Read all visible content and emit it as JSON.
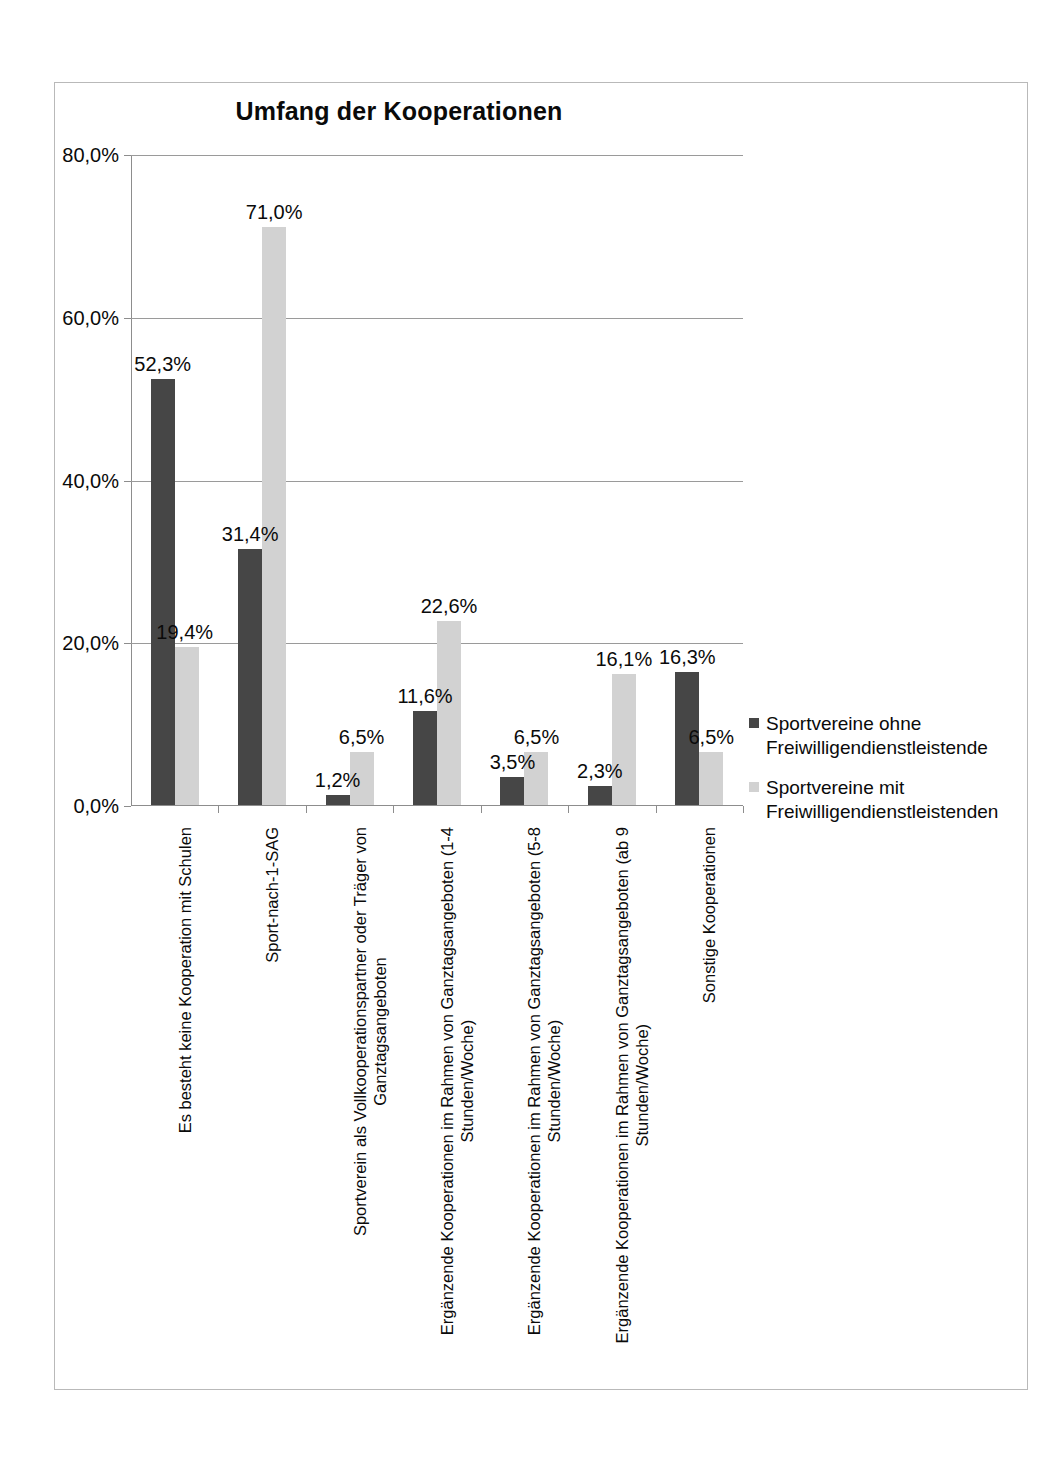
{
  "chart_data": {
    "type": "bar",
    "title": "Umfang der Kooperationen",
    "xlabel": "",
    "ylabel": "",
    "ylim": [
      0,
      80
    ],
    "grid": true,
    "legend_position": "right",
    "ytick_labels": [
      "80,0%",
      "60,0%",
      "40,0%",
      "20,0%",
      "0,0%"
    ],
    "ytick_values": [
      80,
      60,
      40,
      20,
      0
    ],
    "categories": [
      "Es besteht keine Kooperation mit Schulen",
      "Sport-nach-1-SAG",
      "Sportverein als Vollkooperationspartner oder Träger von Ganztagsangeboten",
      "Ergänzende Kooperationen im Rahmen von Ganztagsangeboten (1-4 Stunden/Woche)",
      "Ergänzende Kooperationen im Rahmen von Ganztagsangeboten (5-8 Stunden/Woche)",
      "Ergänzende Kooperationen im Rahmen von Ganztagsangeboten (ab 9 Stunden/Woche)",
      "Sonstige Kooperationen"
    ],
    "categories_lines": [
      [
        "Es besteht keine Kooperation mit Schulen",
        ""
      ],
      [
        "Sport-nach-1-SAG",
        ""
      ],
      [
        "Sportverein als Vollkooperationspartner oder Träger von",
        "Ganztagsangeboten"
      ],
      [
        "Ergänzende Kooperationen im Rahmen von Ganztagsangeboten (1-4",
        "Stunden/Woche)"
      ],
      [
        "Ergänzende Kooperationen im Rahmen von Ganztagsangeboten (5-8",
        "Stunden/Woche)"
      ],
      [
        "Ergänzende Kooperationen im Rahmen von Ganztagsangeboten (ab 9",
        "Stunden/Woche)"
      ],
      [
        "Sonstige Kooperationen",
        ""
      ]
    ],
    "series": [
      {
        "name": "Sportvereine ohne Freiwilligendienstleistende",
        "color": "#464646",
        "values": [
          52.3,
          31.4,
          1.2,
          11.6,
          3.5,
          2.3,
          16.3
        ],
        "labels": [
          "52,3%",
          "31,4%",
          "1,2%",
          "11,6%",
          "3,5%",
          "2,3%",
          "16,3%"
        ]
      },
      {
        "name": "Sportvereine mit Freiwilligendienstleistenden",
        "color": "#d2d2d2",
        "values": [
          19.4,
          71.0,
          6.5,
          22.6,
          6.5,
          16.1,
          6.5
        ],
        "labels": [
          "19,4%",
          "71,0%",
          "6,5%",
          "22,6%",
          "6,5%",
          "16,1%",
          "6,5%"
        ]
      }
    ]
  },
  "legend": {
    "entries": [
      {
        "line1": "Sportvereine ohne",
        "line2": "Freiwilligendienstleistende"
      },
      {
        "line1": "Sportvereine mit",
        "line2": "Freiwilligendienstleistenden"
      }
    ]
  }
}
